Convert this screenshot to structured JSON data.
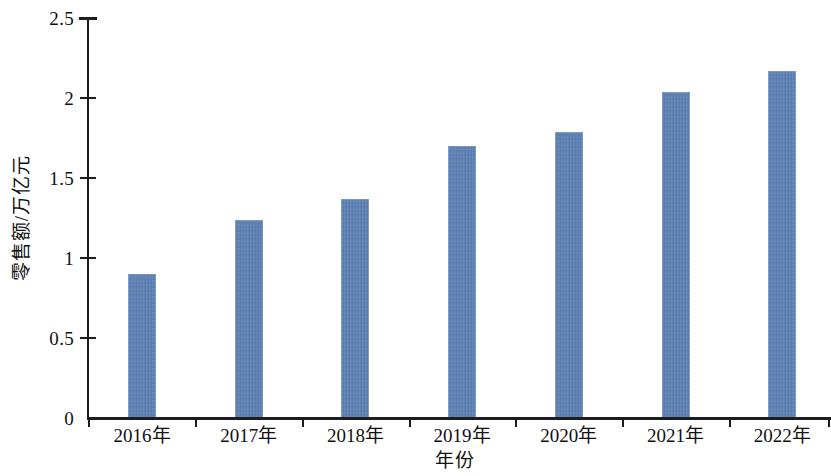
{
  "chart_data": {
    "type": "bar",
    "title": "",
    "xlabel": "年份",
    "ylabel": "零售额/万亿元",
    "categories": [
      "2016年",
      "2017年",
      "2018年",
      "2019年",
      "2020年",
      "2021年",
      "2022年"
    ],
    "values": [
      0.9,
      1.24,
      1.37,
      1.7,
      1.79,
      2.04,
      2.17
    ],
    "series": [
      {
        "name": "零售额",
        "values": [
          0.9,
          1.24,
          1.37,
          1.7,
          1.79,
          2.04,
          2.17
        ]
      }
    ],
    "ylim": [
      0,
      2.5
    ],
    "ytick_labels": [
      "0",
      "0.5",
      "1",
      "1.5",
      "2",
      "2.5"
    ],
    "ytick_values": [
      0,
      0.5,
      1,
      1.5,
      2,
      2.5
    ],
    "grid": false,
    "legend": null,
    "legend_position": "none",
    "bar_color": "#5b7fb5",
    "axis_color": "#1d1d1d",
    "background_color": "#ffffff"
  }
}
